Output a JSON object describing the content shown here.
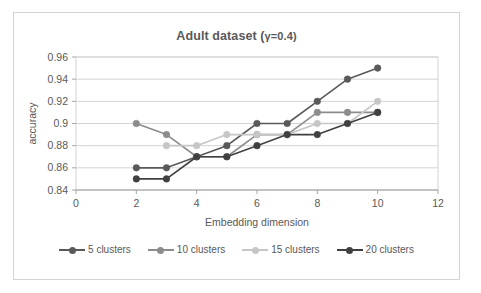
{
  "chart_data": {
    "type": "line",
    "title": "Adult dataset (γ=0.4)",
    "title_main": "Adult dataset (",
    "title_gamma": "γ=0.4)",
    "xlabel": "Embedding dimension",
    "ylabel": "accuracy",
    "xlim": [
      0,
      12
    ],
    "ylim": [
      0.84,
      0.96
    ],
    "xticks": [
      "0",
      "2",
      "4",
      "6",
      "8",
      "10",
      "12"
    ],
    "xtick_values": [
      0,
      2,
      4,
      6,
      8,
      10,
      12
    ],
    "yticks": [
      "0.84",
      "0.86",
      "0.88",
      "0.9",
      "0.92",
      "0.94",
      "0.96"
    ],
    "ytick_values": [
      0.84,
      0.86,
      0.88,
      0.9,
      0.92,
      0.94,
      0.96
    ],
    "grid": "horizontal",
    "legend_position": "bottom",
    "x": [
      2,
      3,
      4,
      5,
      6,
      7,
      8,
      9,
      10
    ],
    "series": [
      {
        "name": "5 clusters",
        "color": "#595959",
        "values": [
          0.86,
          0.86,
          0.87,
          0.88,
          0.9,
          0.9,
          0.92,
          0.94,
          0.95
        ]
      },
      {
        "name": "10 clusters",
        "color": "#8c8c8c",
        "values": [
          0.9,
          0.89,
          0.87,
          0.87,
          0.89,
          0.89,
          0.91,
          0.91,
          0.91
        ]
      },
      {
        "name": "15 clusters",
        "color": "#c6c6c6",
        "values": [
          null,
          0.88,
          0.88,
          0.89,
          0.89,
          0.89,
          0.9,
          0.9,
          0.92
        ]
      },
      {
        "name": "20 clusters",
        "color": "#404040",
        "values": [
          0.85,
          0.85,
          0.87,
          0.87,
          0.88,
          0.89,
          0.89,
          0.9,
          0.91
        ]
      }
    ]
  },
  "frame": {
    "border_color": "#d4d4d4",
    "background": "#ffffff"
  }
}
